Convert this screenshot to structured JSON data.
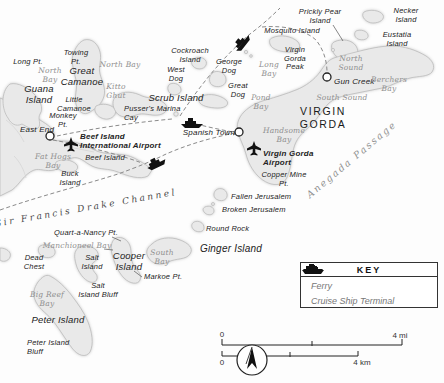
{
  "colors": {
    "land": "#e9e9e9",
    "land_outline": "#bcbcbc",
    "water_label": "#8f8f8f",
    "route_dash": "#8a8a8a",
    "icon_black": "#111111"
  },
  "labels": [
    {
      "name": "prickly-pear-island",
      "text": "Prickly Pear\nIsland"
    },
    {
      "name": "necker-island",
      "text": "Necker\nIsland"
    },
    {
      "name": "eustatia-island",
      "text": "Eustatia Island"
    },
    {
      "name": "mosquito-island",
      "text": "Mosquito Island"
    },
    {
      "name": "cockroach-island",
      "text": "Cockroach\nIsland"
    },
    {
      "name": "towing-pt",
      "text": "Towing\nPt."
    },
    {
      "name": "long-pt",
      "text": "Long Pt."
    },
    {
      "name": "north-bay-west",
      "text": "North\nBay"
    },
    {
      "name": "great-camanoe",
      "text": "Great\nCamanoe"
    },
    {
      "name": "north-bay-east",
      "text": "North Bay"
    },
    {
      "name": "kitto-ghut",
      "text": "Kitto\nGhut"
    },
    {
      "name": "guana-island",
      "text": "Guana\nIsland"
    },
    {
      "name": "little-camanoe",
      "text": "Little\nCamanoe"
    },
    {
      "name": "monkey-pt",
      "text": "Monkey\nPt."
    },
    {
      "name": "george-dog",
      "text": "George\nDog"
    },
    {
      "name": "west-dog",
      "text": "West\nDog"
    },
    {
      "name": "great-dog",
      "text": "Great\nDog"
    },
    {
      "name": "long-bay",
      "text": "Long\nBay"
    },
    {
      "name": "virgin-gorda-peak",
      "text": "Virgin\nGorda\nPeak"
    },
    {
      "name": "scrub-island",
      "text": "Scrub Island"
    },
    {
      "name": "north-sound",
      "text": "North\nSound"
    },
    {
      "name": "gun-creek",
      "text": "Gun Creek"
    },
    {
      "name": "berchers-bay",
      "text": "Berchers\nBay"
    },
    {
      "name": "south-sound",
      "text": "South Sound"
    },
    {
      "name": "virgin-gorda",
      "text": "VIRGIN\nGORDA"
    },
    {
      "name": "east-end",
      "text": "East End"
    },
    {
      "name": "beef-island-airport",
      "text": "Beef Island\nInternational Airport"
    },
    {
      "name": "pussers-marina-cay",
      "text": "Pusser's Marina\nCay"
    },
    {
      "name": "fat-hogs-bay",
      "text": "Fat Hogs\nBay"
    },
    {
      "name": "beef-island",
      "text": "Beef Island"
    },
    {
      "name": "buck-island",
      "text": "Buck\nIsland"
    },
    {
      "name": "spanish-town",
      "text": "Spanish Town"
    },
    {
      "name": "virgin-gorda-airport",
      "text": "Virgin Gorda\nAirport"
    },
    {
      "name": "handsome-bay",
      "text": "Handsome\nBay"
    },
    {
      "name": "pond-bay",
      "text": "Pond\nBay"
    },
    {
      "name": "copper-mine-pt",
      "text": "Copper Mine\nPt."
    },
    {
      "name": "anegada-passage",
      "text": "Anegada Passage"
    },
    {
      "name": "fallen-jerusalem",
      "text": "Fallen Jerusalem"
    },
    {
      "name": "broken-jerusalem",
      "text": "Broken Jerusalem"
    },
    {
      "name": "round-rock",
      "text": "Round Rock"
    },
    {
      "name": "ginger-island",
      "text": "Ginger Island"
    },
    {
      "name": "south-bay",
      "text": "South\nBay"
    },
    {
      "name": "markoe-pt",
      "text": "Markoe Pt."
    },
    {
      "name": "sir-francis-drake-channel",
      "text": "Sir Francis Drake Channel"
    },
    {
      "name": "quart-a-nancy-pt",
      "text": "Quart-a-Nancy Pt."
    },
    {
      "name": "manchioneel-bay",
      "text": "Manchioneel Bay"
    },
    {
      "name": "dead-chest",
      "text": "Dead\nChest"
    },
    {
      "name": "salt-island",
      "text": "Salt\nIsland"
    },
    {
      "name": "cooper-island",
      "text": "Cooper\nIsland"
    },
    {
      "name": "salt-island-bluff",
      "text": "Salt\nIsland Bluff"
    },
    {
      "name": "big-reef-bay",
      "text": "Big Reef\nBay"
    },
    {
      "name": "peter-island",
      "text": "Peter Island"
    },
    {
      "name": "peter-island-bluff",
      "text": "Peter Island\nBluff"
    }
  ],
  "key": {
    "title": "KEY",
    "items": [
      {
        "icon": "ferry-icon",
        "label": "Ferry"
      },
      {
        "icon": "cruise-ship-icon",
        "label": "Cruise Ship Terminal"
      }
    ]
  },
  "scale": {
    "mi_start": "0",
    "mi_end": "4 mi",
    "km_start": "0",
    "km_end": "4 km"
  }
}
